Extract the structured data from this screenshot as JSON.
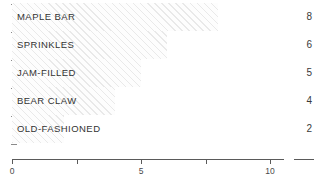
{
  "chart_data": {
    "type": "bar",
    "orientation": "horizontal",
    "title": "",
    "xlabel": "",
    "ylabel": "",
    "categories": [
      "MAPLE BAR",
      "SPRINKLES",
      "JAM-FILLED",
      "BEAR CLAW",
      "OLD-FASHIONED"
    ],
    "values": [
      8,
      6,
      5,
      4,
      2
    ],
    "value_labels": [
      "8",
      "6",
      "5",
      "4",
      "2"
    ],
    "xlim": [
      0,
      10
    ],
    "xticks": [
      0,
      2.5,
      5,
      7.5,
      10
    ],
    "xtick_labels": [
      "0",
      "",
      "5",
      "",
      "10"
    ],
    "grid": false,
    "legend": null,
    "bar_style": "diagonal-hatch",
    "colors": {
      "bar_hatch": "#e9e9e9",
      "bar_fill": "#fdfdfd",
      "axis": "#5a5a5a",
      "label_text": "#333333",
      "value_text": "#3a3a3a",
      "tick_text": "#4a4a4a"
    }
  }
}
